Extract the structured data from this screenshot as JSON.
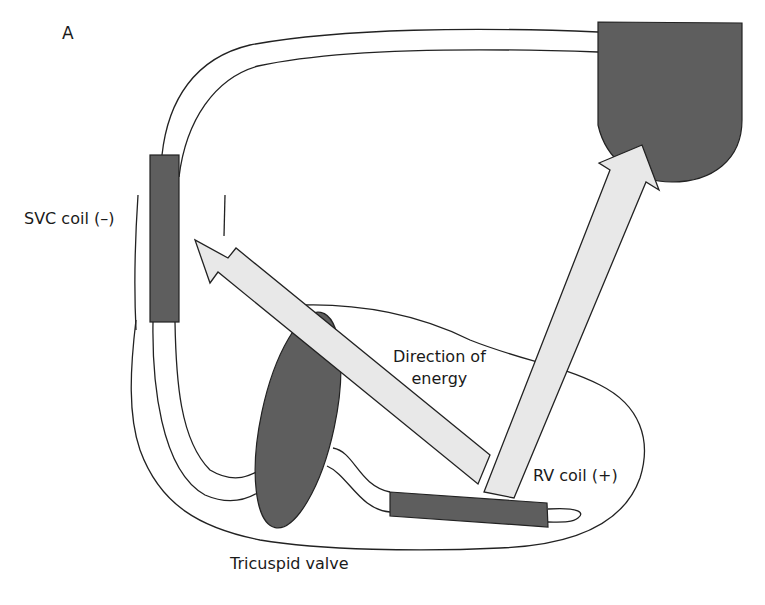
{
  "figure": {
    "panel_label": "A",
    "labels": {
      "svc_coil": "SVC coil (–)",
      "direction_line1": "Direction of",
      "direction_line2": "energy",
      "rv_coil": "RV coil (+)",
      "tricuspid_valve": "Tricuspid valve"
    },
    "colors": {
      "coil_fill": "#5e5e5e",
      "arrow_fill": "#e8e8e8",
      "outline": "#222222",
      "background": "#ffffff"
    },
    "elements": [
      "implantable-defibrillator-can",
      "lead",
      "svc-coil",
      "rv-coil",
      "tricuspid-valve",
      "energy-arrow-to-svc",
      "energy-arrow-to-can",
      "right-ventricle-outline",
      "svc-vessel-wall"
    ]
  }
}
